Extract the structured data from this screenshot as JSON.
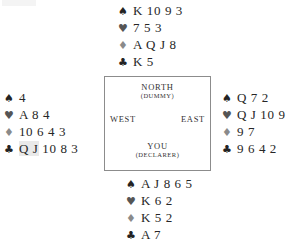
{
  "diagram": {
    "suit_symbols": {
      "spade": "♠",
      "heart": "♥",
      "diamond": "♦",
      "club": "♣"
    },
    "suit_colors": {
      "spade": "#232323",
      "heart": "#555555",
      "diamond": "#8a8a8a",
      "club": "#232323"
    },
    "background": "#ffffff",
    "border_color": "#8c8c8c"
  },
  "compass": {
    "north": "NORTH",
    "north_role": "(DUMMY)",
    "west": "WEST",
    "east": "EAST",
    "south": "YOU",
    "south_role": "(DECLARER)"
  },
  "hands": {
    "north": {
      "position": "NORTH",
      "spades": "K 10 9 3",
      "hearts": "7 5 3",
      "diamonds": "A Q J 8",
      "clubs": "K 5"
    },
    "west": {
      "position": "WEST",
      "spades": "4",
      "hearts": "A 8 4",
      "diamonds": "10 6 4 3",
      "clubs_highlight": "Q J",
      "clubs_rest": " 10 8 3"
    },
    "east": {
      "position": "EAST",
      "spades": "Q 7 2",
      "hearts": "Q J 10 9",
      "diamonds": "9 7",
      "clubs": "9 6 4 2"
    },
    "south": {
      "position": "SOUTH",
      "spades": "A J 8 6 5",
      "hearts": "K 6 2",
      "diamonds": "K 5 2",
      "clubs": "A 7"
    }
  }
}
